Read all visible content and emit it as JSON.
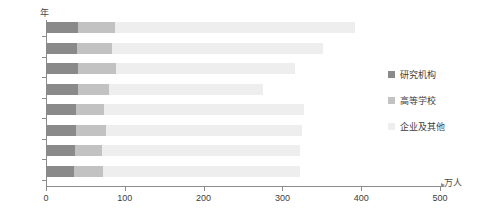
{
  "chart_data": {
    "type": "bar",
    "orientation": "horizontal",
    "stacked": true,
    "title": "",
    "xlabel": "万人",
    "ylabel": "年",
    "categories": [
      "2007",
      "2006",
      "2005",
      "2004",
      "2003",
      "2002",
      "2001",
      "2000"
    ],
    "xlim": [
      0,
      500
    ],
    "xticks": [
      0,
      100,
      200,
      300,
      400,
      500
    ],
    "xtick_labels": [
      "0",
      "100",
      "200",
      "300",
      "400",
      "500"
    ],
    "grid": false,
    "legend_position": "right",
    "series": [
      {
        "name": "研究机构",
        "color": "#8a8a8a",
        "values": [
          40,
          39,
          41,
          40,
          38,
          38,
          37,
          36
        ]
      },
      {
        "name": "高等学校",
        "color": "#c2c2c2",
        "values": [
          47,
          45,
          48,
          40,
          36,
          38,
          34,
          36
        ]
      },
      {
        "name": "企业及其他",
        "color": "#eeeeee",
        "values": [
          305,
          267,
          227,
          196,
          254,
          249,
          251,
          250
        ]
      }
    ],
    "totals": [
      392,
      351,
      316,
      276,
      328,
      325,
      322,
      322
    ]
  },
  "axes": {
    "y_unit_label": "年",
    "x_unit_label": "万人"
  },
  "legend": {
    "items": [
      {
        "label": "研究机构",
        "color": "#8a8a8a"
      },
      {
        "label": "高等学校",
        "color": "#c2c2c2"
      },
      {
        "label": "企业及其他",
        "color": "#eeeeee"
      }
    ]
  }
}
